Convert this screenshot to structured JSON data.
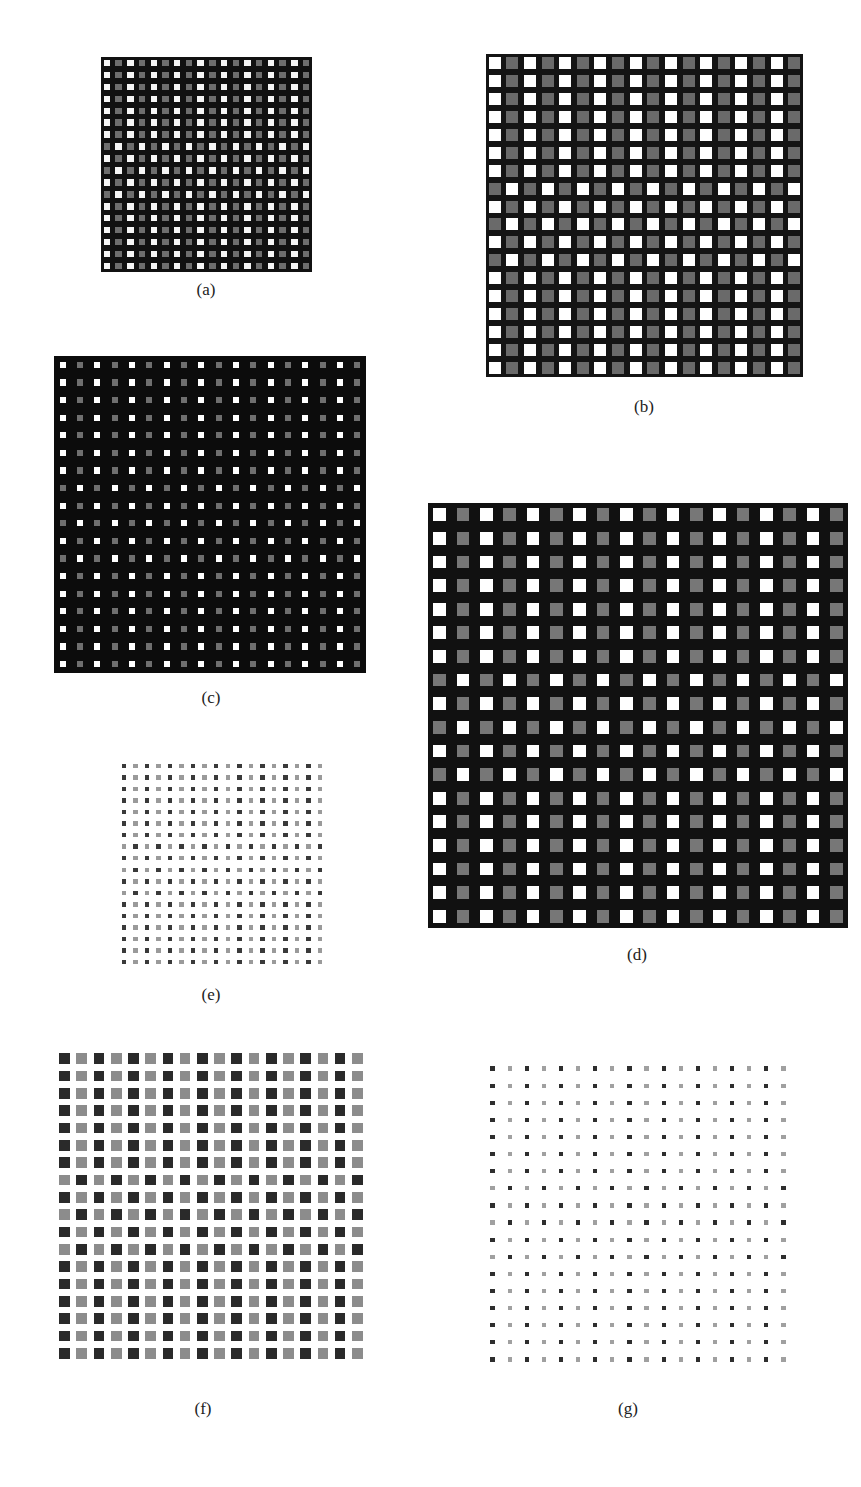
{
  "page": {
    "running_header_fragment": "",
    "background": "#ffffff"
  },
  "figure": {
    "grid_size": 18,
    "pattern_description": "Alternating bright/dim columns; rows 8, 10 and 12 (1-indexed) are phase-inverted",
    "shifted_rows": [
      8,
      10,
      12
    ],
    "panels": [
      {
        "id": "a",
        "label": "(a)",
        "x": 101,
        "y": 57,
        "w": 211,
        "h": 215,
        "bg": "#111111",
        "bright": "#f6f6f6",
        "dim": "#6e6e6e",
        "cell_fill": 0.55,
        "label_x": 206,
        "label_y": 280
      },
      {
        "id": "b",
        "label": "(b)",
        "x": 486,
        "y": 54,
        "w": 317,
        "h": 323,
        "bg": "#141414",
        "bright": "#ffffff",
        "dim": "#6a6a6a",
        "cell_fill": 0.68,
        "label_x": 644,
        "label_y": 397
      },
      {
        "id": "c",
        "label": "(c)",
        "x": 54,
        "y": 356,
        "w": 312,
        "h": 317,
        "bg": "#0c0c0c",
        "bright": "#ffffff",
        "dim": "#6f6f6f",
        "cell_fill": 0.36,
        "label_x": 211,
        "label_y": 688
      },
      {
        "id": "d",
        "label": "(d)",
        "x": 428,
        "y": 503,
        "w": 420,
        "h": 425,
        "bg": "#111111",
        "bright": "#ffffff",
        "dim": "#777777",
        "cell_fill": 0.55,
        "label_x": 637,
        "label_y": 945
      },
      {
        "id": "e",
        "label": "(e)",
        "x": 118,
        "y": 760,
        "w": 208,
        "h": 208,
        "bg": "#ffffff",
        "bright": "#3a3a3a",
        "dim": "#9a9a9a",
        "cell_fill": 0.38,
        "label_x": 211,
        "label_y": 985
      },
      {
        "id": "f",
        "label": "(f)",
        "x": 56,
        "y": 1050,
        "w": 310,
        "h": 312,
        "bg": "#ffffff",
        "bright": "#2a2a2a",
        "dim": "#8c8c8c",
        "cell_fill": 0.62,
        "label_x": 203,
        "label_y": 1399
      },
      {
        "id": "g",
        "label": "(g)",
        "x": 484,
        "y": 1060,
        "w": 308,
        "h": 308,
        "bg": "#ffffff",
        "bright": "#2e2e2e",
        "dim": "#a0a0a0",
        "cell_fill": 0.25,
        "label_x": 628,
        "label_y": 1399
      }
    ]
  }
}
